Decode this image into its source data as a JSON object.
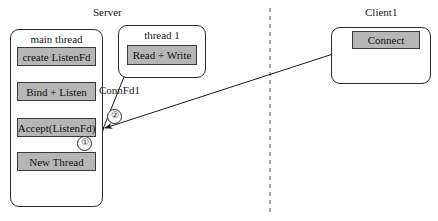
{
  "diagram": {
    "title_server": "Server",
    "title_client": "Client1"
  },
  "server": {
    "main_thread": {
      "title": "main thread",
      "steps": [
        {
          "label": "create ListenFd"
        },
        {
          "label": "Bind + Listen"
        },
        {
          "label": "Accept(ListenFd)"
        },
        {
          "label": "New Thread"
        }
      ]
    },
    "thread1": {
      "title": "thread 1",
      "steps": [
        {
          "label": "Read + Write"
        }
      ]
    }
  },
  "client": {
    "title": "Client1",
    "steps": [
      {
        "label": "Connect"
      }
    ]
  },
  "edges": {
    "conn_fd_label": "ConnFd1",
    "marker_one": "①",
    "marker_two": "②"
  },
  "colors": {
    "box_fill": "#b6b6b6",
    "box_stroke": "#3a3a3a",
    "panel_stroke": "#2b2b2b",
    "divider": "#555555",
    "background": "#ffffff"
  }
}
